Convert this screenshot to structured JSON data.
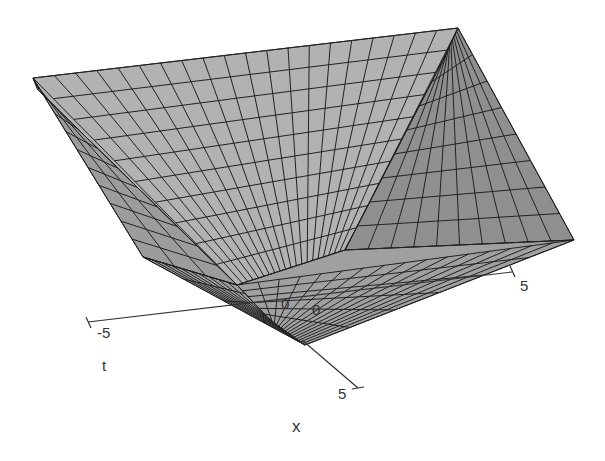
{
  "chart_data": {
    "type": "surface3d",
    "title": "",
    "function_shape": "inverted square pyramid (bowl) surface over x,t in [-5,5], minimum at origin",
    "x_axis": {
      "label": "x",
      "ticks": [
        "0",
        "5"
      ],
      "range": [
        0,
        5
      ]
    },
    "t_axis": {
      "label": "t",
      "ticks": [
        "-5",
        "0",
        "5"
      ],
      "range": [
        -5,
        5
      ]
    },
    "grid_resolution": 20,
    "surface_color": "#a8a8a8",
    "grid_line_color": "#222222",
    "faces": [
      {
        "name": "back-floor",
        "pts": [
          [
            33,
            78
          ],
          [
            458,
            28
          ],
          [
            444,
            58
          ],
          [
            345,
            250
          ],
          [
            237,
            285
          ],
          [
            38,
            90
          ]
        ],
        "shade": "#b2b2b2"
      },
      {
        "name": "left-slope",
        "pts": [
          [
            33,
            78
          ],
          [
            38,
            90
          ],
          [
            237,
            285
          ],
          [
            143,
            257
          ]
        ],
        "shade": "#9c9c9c"
      },
      {
        "name": "right-slope",
        "pts": [
          [
            458,
            28
          ],
          [
            574,
            240
          ],
          [
            345,
            250
          ],
          [
            444,
            58
          ]
        ],
        "shade": "#8f8f8f"
      },
      {
        "name": "front-slope",
        "pts": [
          [
            143,
            257
          ],
          [
            237,
            285
          ],
          [
            345,
            250
          ],
          [
            574,
            240
          ],
          [
            305,
            345
          ]
        ],
        "shade": "#a0a0a0"
      }
    ],
    "axes_2d": {
      "t_axis_line": [
        [
          88,
          322
        ],
        [
          512,
          272
        ]
      ],
      "x_axis_line": [
        [
          302,
          340
        ],
        [
          358,
          388
        ]
      ]
    }
  },
  "labels": {
    "t_min": "-5",
    "t_zero": "0",
    "t_max": "5",
    "x_zero": "0",
    "x_max": "5",
    "t_name": "t",
    "x_name": "x"
  }
}
